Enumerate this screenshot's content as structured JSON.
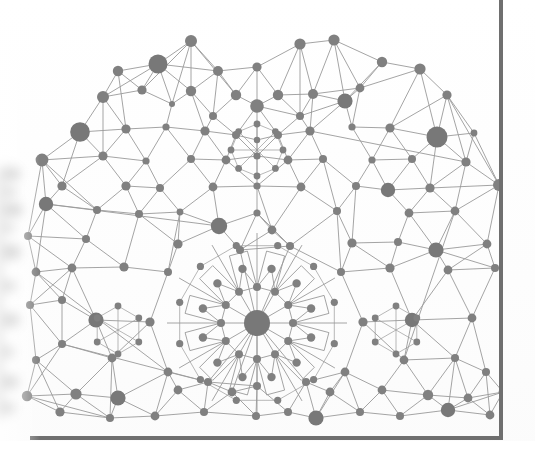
{
  "page": {
    "width": 535,
    "height": 468,
    "background_color": "#ffffff",
    "paper_tint": "#fcfcfc",
    "kind": "scanned-book-page"
  },
  "frame": {
    "name": "figure-rule",
    "color": "#6f6f6f",
    "right_rule": {
      "x": 501,
      "y_top": 0,
      "y_bottom": 440,
      "thickness": 4
    },
    "bottom_rule": {
      "y": 437,
      "x_left": 30,
      "x_right": 503,
      "thickness": 4
    }
  },
  "graph_style": {
    "node_fill": "#808080",
    "node_fill_dark": "#787878",
    "edge_color": "#9a9a9a",
    "edge_width": 0.9,
    "edge_width_thin": 0.7,
    "node_count_label": "",
    "legend": ""
  },
  "chart_data": {
    "type": "scatter",
    "title": "",
    "subtitle": "",
    "xlabel": "",
    "ylabel": "",
    "grid": false,
    "legend_position": "none",
    "xlim": [
      0,
      535
    ],
    "ylim": [
      0,
      468
    ],
    "rosette": {
      "center": [
        257,
        323
      ],
      "hub_radius": 13,
      "spokes": 12,
      "inner_ring_radius": 36,
      "inner_ring_node_radius": 4.0,
      "outer_ring_radius": 56,
      "outer_ring_node_radius": 4.2,
      "star_polygon_radius": 46,
      "petal_count": 12
    },
    "secondary_rosettes": [
      {
        "center": [
          257,
          150
        ],
        "spokes": 8,
        "ring_radius": 26
      },
      {
        "center": [
          118,
          330
        ],
        "spokes": 6,
        "ring_radius": 24
      },
      {
        "center": [
          396,
          330
        ],
        "spokes": 6,
        "ring_radius": 24
      }
    ],
    "nodes": [
      {
        "x": 191,
        "y": 41,
        "r": 6.0
      },
      {
        "x": 300,
        "y": 44,
        "r": 5.6
      },
      {
        "x": 334,
        "y": 40,
        "r": 5.6
      },
      {
        "x": 158,
        "y": 64,
        "r": 9.5
      },
      {
        "x": 118,
        "y": 71,
        "r": 5.2
      },
      {
        "x": 218,
        "y": 71,
        "r": 5.0
      },
      {
        "x": 257,
        "y": 67,
        "r": 4.6
      },
      {
        "x": 382,
        "y": 62,
        "r": 5.2
      },
      {
        "x": 420,
        "y": 69,
        "r": 5.6
      },
      {
        "x": 103,
        "y": 97,
        "r": 6.0
      },
      {
        "x": 142,
        "y": 90,
        "r": 4.6
      },
      {
        "x": 191,
        "y": 91,
        "r": 5.2
      },
      {
        "x": 236,
        "y": 95,
        "r": 5.2
      },
      {
        "x": 257,
        "y": 106,
        "r": 6.8
      },
      {
        "x": 278,
        "y": 95,
        "r": 5.2
      },
      {
        "x": 313,
        "y": 94,
        "r": 5.0
      },
      {
        "x": 345,
        "y": 101,
        "r": 7.6
      },
      {
        "x": 360,
        "y": 88,
        "r": 4.4
      },
      {
        "x": 447,
        "y": 95,
        "r": 4.6
      },
      {
        "x": 172,
        "y": 104,
        "r": 3.0
      },
      {
        "x": 213,
        "y": 116,
        "r": 4.0
      },
      {
        "x": 300,
        "y": 116,
        "r": 4.0
      },
      {
        "x": 80,
        "y": 132,
        "r": 9.8
      },
      {
        "x": 126,
        "y": 129,
        "r": 4.6
      },
      {
        "x": 166,
        "y": 127,
        "r": 3.6
      },
      {
        "x": 205,
        "y": 131,
        "r": 4.6
      },
      {
        "x": 236,
        "y": 135,
        "r": 4.0
      },
      {
        "x": 257,
        "y": 140,
        "r": 3.2
      },
      {
        "x": 278,
        "y": 135,
        "r": 4.0
      },
      {
        "x": 310,
        "y": 131,
        "r": 4.6
      },
      {
        "x": 352,
        "y": 127,
        "r": 3.6
      },
      {
        "x": 390,
        "y": 128,
        "r": 4.6
      },
      {
        "x": 437,
        "y": 137,
        "r": 10.5
      },
      {
        "x": 474,
        "y": 133,
        "r": 3.4
      },
      {
        "x": 42,
        "y": 160,
        "r": 6.4
      },
      {
        "x": 103,
        "y": 156,
        "r": 4.6
      },
      {
        "x": 146,
        "y": 161,
        "r": 3.6
      },
      {
        "x": 191,
        "y": 159,
        "r": 4.0
      },
      {
        "x": 226,
        "y": 160,
        "r": 4.4
      },
      {
        "x": 257,
        "y": 156,
        "r": 3.6
      },
      {
        "x": 288,
        "y": 160,
        "r": 4.4
      },
      {
        "x": 323,
        "y": 159,
        "r": 4.0
      },
      {
        "x": 372,
        "y": 160,
        "r": 3.6
      },
      {
        "x": 412,
        "y": 159,
        "r": 4.0
      },
      {
        "x": 466,
        "y": 162,
        "r": 4.6
      },
      {
        "x": 62,
        "y": 186,
        "r": 4.6
      },
      {
        "x": 126,
        "y": 186,
        "r": 4.6
      },
      {
        "x": 160,
        "y": 188,
        "r": 4.0
      },
      {
        "x": 213,
        "y": 187,
        "r": 4.4
      },
      {
        "x": 257,
        "y": 186,
        "r": 3.6
      },
      {
        "x": 301,
        "y": 187,
        "r": 4.4
      },
      {
        "x": 356,
        "y": 186,
        "r": 4.0
      },
      {
        "x": 388,
        "y": 190,
        "r": 7.2
      },
      {
        "x": 430,
        "y": 188,
        "r": 4.6
      },
      {
        "x": 499,
        "y": 185,
        "r": 6.0
      },
      {
        "x": 46,
        "y": 204,
        "r": 7.2
      },
      {
        "x": 97,
        "y": 210,
        "r": 4.0
      },
      {
        "x": 139,
        "y": 214,
        "r": 4.0
      },
      {
        "x": 180,
        "y": 212,
        "r": 3.4
      },
      {
        "x": 219,
        "y": 226,
        "r": 8.2
      },
      {
        "x": 257,
        "y": 213,
        "r": 3.6
      },
      {
        "x": 272,
        "y": 230,
        "r": 4.4
      },
      {
        "x": 337,
        "y": 211,
        "r": 4.0
      },
      {
        "x": 409,
        "y": 213,
        "r": 4.4
      },
      {
        "x": 455,
        "y": 211,
        "r": 4.4
      },
      {
        "x": 28,
        "y": 236,
        "r": 4.0
      },
      {
        "x": 86,
        "y": 239,
        "r": 4.0
      },
      {
        "x": 178,
        "y": 244,
        "r": 4.6
      },
      {
        "x": 240,
        "y": 250,
        "r": 4.0
      },
      {
        "x": 290,
        "y": 246,
        "r": 4.0
      },
      {
        "x": 352,
        "y": 243,
        "r": 4.6
      },
      {
        "x": 398,
        "y": 242,
        "r": 4.0
      },
      {
        "x": 436,
        "y": 250,
        "r": 7.6
      },
      {
        "x": 487,
        "y": 244,
        "r": 4.4
      },
      {
        "x": 36,
        "y": 272,
        "r": 4.4
      },
      {
        "x": 72,
        "y": 268,
        "r": 4.4
      },
      {
        "x": 124,
        "y": 267,
        "r": 4.6
      },
      {
        "x": 168,
        "y": 272,
        "r": 4.0
      },
      {
        "x": 341,
        "y": 272,
        "r": 4.0
      },
      {
        "x": 390,
        "y": 268,
        "r": 4.6
      },
      {
        "x": 448,
        "y": 270,
        "r": 4.4
      },
      {
        "x": 495,
        "y": 268,
        "r": 4.0
      },
      {
        "x": 30,
        "y": 305,
        "r": 4.0
      },
      {
        "x": 96,
        "y": 320,
        "r": 7.6
      },
      {
        "x": 150,
        "y": 322,
        "r": 4.6
      },
      {
        "x": 257,
        "y": 323,
        "r": 13.0
      },
      {
        "x": 363,
        "y": 322,
        "r": 4.6
      },
      {
        "x": 412,
        "y": 320,
        "r": 7.2
      },
      {
        "x": 472,
        "y": 318,
        "r": 4.4
      },
      {
        "x": 62,
        "y": 300,
        "r": 4.0
      },
      {
        "x": 62,
        "y": 344,
        "r": 4.0
      },
      {
        "x": 36,
        "y": 360,
        "r": 4.0
      },
      {
        "x": 112,
        "y": 358,
        "r": 4.4
      },
      {
        "x": 168,
        "y": 372,
        "r": 4.4
      },
      {
        "x": 208,
        "y": 382,
        "r": 4.0
      },
      {
        "x": 257,
        "y": 386,
        "r": 4.0
      },
      {
        "x": 306,
        "y": 382,
        "r": 4.0
      },
      {
        "x": 345,
        "y": 372,
        "r": 4.4
      },
      {
        "x": 404,
        "y": 360,
        "r": 4.4
      },
      {
        "x": 455,
        "y": 358,
        "r": 4.0
      },
      {
        "x": 486,
        "y": 372,
        "r": 4.0
      },
      {
        "x": 27,
        "y": 396,
        "r": 5.2
      },
      {
        "x": 76,
        "y": 394,
        "r": 5.6
      },
      {
        "x": 118,
        "y": 398,
        "r": 7.6
      },
      {
        "x": 178,
        "y": 390,
        "r": 4.4
      },
      {
        "x": 232,
        "y": 392,
        "r": 4.4
      },
      {
        "x": 330,
        "y": 392,
        "r": 4.4
      },
      {
        "x": 382,
        "y": 390,
        "r": 4.4
      },
      {
        "x": 428,
        "y": 395,
        "r": 5.2
      },
      {
        "x": 468,
        "y": 398,
        "r": 4.4
      },
      {
        "x": 503,
        "y": 392,
        "r": 4.4
      },
      {
        "x": 60,
        "y": 412,
        "r": 4.6
      },
      {
        "x": 110,
        "y": 418,
        "r": 4.0
      },
      {
        "x": 155,
        "y": 416,
        "r": 4.4
      },
      {
        "x": 204,
        "y": 412,
        "r": 4.0
      },
      {
        "x": 256,
        "y": 416,
        "r": 4.0
      },
      {
        "x": 288,
        "y": 412,
        "r": 4.0
      },
      {
        "x": 316,
        "y": 418,
        "r": 7.6
      },
      {
        "x": 360,
        "y": 412,
        "r": 4.0
      },
      {
        "x": 400,
        "y": 416,
        "r": 4.0
      },
      {
        "x": 448,
        "y": 410,
        "r": 7.2
      },
      {
        "x": 490,
        "y": 415,
        "r": 4.4
      }
    ]
  },
  "labels": {
    "figure_caption": "",
    "page_number": ""
  }
}
